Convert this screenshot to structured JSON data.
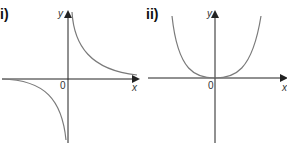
{
  "graphs": [
    {
      "label": "i)",
      "description": "Reciprocal graph y = k/x with branches in quadrants 1 and 3",
      "x_axis_label": "x",
      "y_axis_label": "y",
      "origin_label": "0"
    },
    {
      "label": "ii)",
      "description": "Quartic-like curve y = kx^4 touching origin",
      "x_axis_label": "x",
      "y_axis_label": "y",
      "origin_label": "0"
    }
  ],
  "colors": {
    "axis": "#222222",
    "curve": "#7a7a7a"
  }
}
